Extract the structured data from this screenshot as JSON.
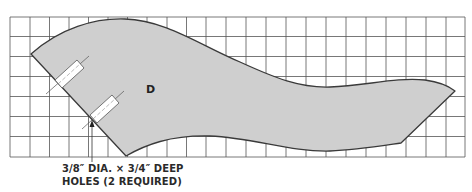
{
  "diagram": {
    "type": "woodworking-pattern",
    "grid": {
      "columns": 23,
      "rows": 7,
      "cell_size_px": 19.8,
      "line_color": "#555555"
    },
    "part": {
      "label": "D",
      "fill_color": "#cfcfcf",
      "outline_color": "#3a3a3a"
    },
    "holes": {
      "count": 2,
      "fill_color": "#ffffff"
    },
    "callout": {
      "line1": "3/8″ DIA. × 3/4″ DEEP",
      "line2": "HOLES (2 REQUIRED)"
    }
  }
}
